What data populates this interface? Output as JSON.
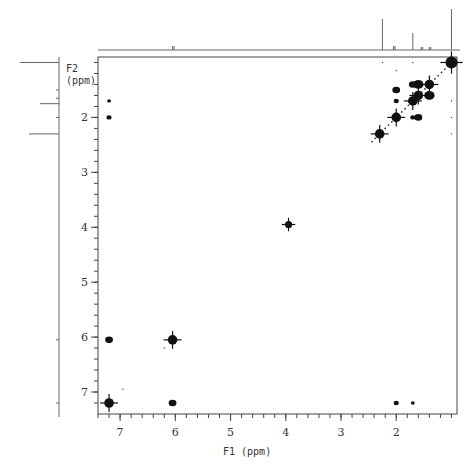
{
  "chart_data": {
    "type": "scatter",
    "subtype": "2D NMR COSY contour plot",
    "title": "",
    "xlabel": "F1 (ppm)",
    "ylabel_line1": "F2",
    "ylabel_line2": "(ppm)",
    "xlim": [
      7.4,
      0.9
    ],
    "ylim": [
      0.9,
      7.4
    ],
    "x_ticks": [
      7,
      6,
      5,
      4,
      3,
      2
    ],
    "y_ticks": [
      2,
      3,
      4,
      5,
      6,
      7
    ],
    "grid": false,
    "diagonal_peaks": [
      {
        "x": 1.0,
        "y": 1.0,
        "size": 5
      },
      {
        "x": 1.4,
        "y": 1.4,
        "size": 4
      },
      {
        "x": 1.6,
        "y": 1.6,
        "size": 4
      },
      {
        "x": 1.7,
        "y": 1.7,
        "size": 4
      },
      {
        "x": 2.0,
        "y": 2.0,
        "size": 4
      },
      {
        "x": 2.3,
        "y": 2.3,
        "size": 4
      },
      {
        "x": 3.95,
        "y": 3.95,
        "size": 3
      },
      {
        "x": 6.05,
        "y": 6.05,
        "size": 4
      },
      {
        "x": 7.2,
        "y": 7.2,
        "size": 4
      }
    ],
    "cross_peaks": [
      {
        "x": 1.6,
        "y": 1.4,
        "size": 4
      },
      {
        "x": 1.4,
        "y": 1.6,
        "size": 4
      },
      {
        "x": 1.7,
        "y": 1.4,
        "size": 3
      },
      {
        "x": 2.0,
        "y": 1.5,
        "size": 3
      },
      {
        "x": 2.0,
        "y": 1.7,
        "size": 2
      },
      {
        "x": 1.6,
        "y": 2.0,
        "size": 3
      },
      {
        "x": 1.7,
        "y": 2.0,
        "size": 2
      },
      {
        "x": 7.2,
        "y": 1.7,
        "size": 1.5
      },
      {
        "x": 7.2,
        "y": 2.0,
        "size": 2
      },
      {
        "x": 7.2,
        "y": 6.05,
        "size": 3
      },
      {
        "x": 6.05,
        "y": 7.2,
        "size": 3
      },
      {
        "x": 2.0,
        "y": 7.2,
        "size": 2
      },
      {
        "x": 1.7,
        "y": 7.2,
        "size": 1.5
      }
    ],
    "f1_projection_peaks": [
      {
        "ppm": 2.25,
        "height": 31
      },
      {
        "ppm": 2.05,
        "height": 4
      },
      {
        "ppm": 1.7,
        "height": 17
      },
      {
        "ppm": 1.55,
        "height": 3
      },
      {
        "ppm": 1.4,
        "height": 3
      },
      {
        "ppm": 1.0,
        "height": 41
      },
      {
        "ppm": 6.05,
        "height": 4
      }
    ],
    "f2_projection_peaks": [
      {
        "ppm": 1.0,
        "height": 39
      },
      {
        "ppm": 1.5,
        "height": 3
      },
      {
        "ppm": 1.65,
        "height": 3
      },
      {
        "ppm": 1.75,
        "height": 19
      },
      {
        "ppm": 2.0,
        "height": 3
      },
      {
        "ppm": 2.3,
        "height": 30
      },
      {
        "ppm": 6.05,
        "height": 3
      },
      {
        "ppm": 7.2,
        "height": 3
      }
    ]
  }
}
